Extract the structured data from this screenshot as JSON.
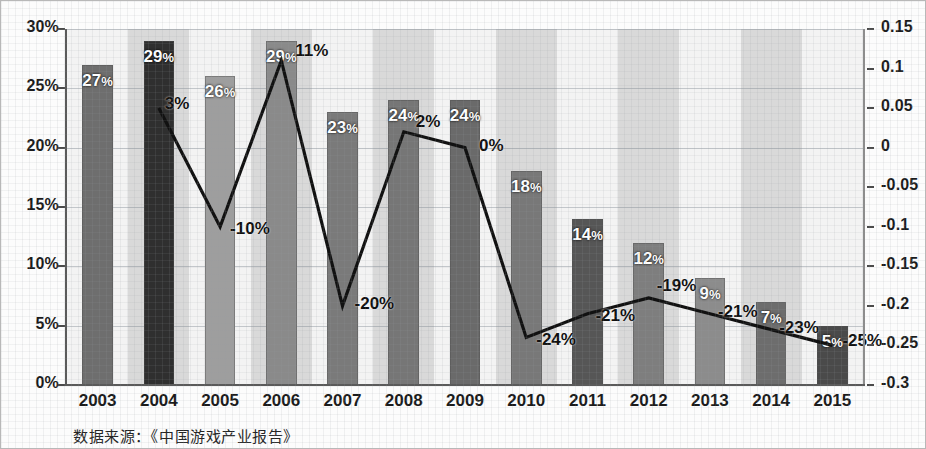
{
  "chart_data": {
    "type": "bar",
    "title": "",
    "subtitle": "",
    "xlabel": "",
    "ylabel": "",
    "categories": [
      "2003",
      "2004",
      "2005",
      "2006",
      "2007",
      "2008",
      "2009",
      "2010",
      "2011",
      "2012",
      "2013",
      "2014",
      "2015"
    ],
    "grid": true,
    "legend_position": "none",
    "series": [
      {
        "name": "bar-series",
        "chart_type": "bar",
        "axis": "left",
        "values": [
          27,
          29,
          26,
          29,
          23,
          24,
          24,
          18,
          14,
          12,
          9,
          7,
          5
        ],
        "labels": [
          "27%",
          "29%",
          "26%",
          "29%",
          "23%",
          "24%",
          "24%",
          "18%",
          "14%",
          "12%",
          "9%",
          "7%",
          "5%"
        ],
        "colors": [
          "#6e6e6e",
          "#2f2f2f",
          "#9e9e9e",
          "#8a8a8a",
          "#7a7a7a",
          "#767676",
          "#6a6a6a",
          "#787878",
          "#565656",
          "#7e7e7e",
          "#8c8c8c",
          "#6d6d6d",
          "#4a4a4a"
        ]
      },
      {
        "name": "line-series",
        "chart_type": "line",
        "axis": "right",
        "x": [
          "2004",
          "2005",
          "2006",
          "2007",
          "2008",
          "2009",
          "2010",
          "2011",
          "2012",
          "2013",
          "2014",
          "2015"
        ],
        "values": [
          0.05,
          -0.1,
          0.11,
          -0.2,
          0.02,
          0.0,
          -0.24,
          -0.21,
          -0.19,
          -0.21,
          -0.23,
          -0.25
        ],
        "labels": [
          "3%",
          "-10%",
          "11%",
          "-20%",
          "2%",
          "0%",
          "-24%",
          "-21%",
          "-19%",
          "-21%",
          "-23%",
          "-25%"
        ],
        "color": "#111111"
      }
    ],
    "left_axis": {
      "ticks": [
        "0%",
        "5%",
        "10%",
        "15%",
        "20%",
        "25%",
        "30%"
      ],
      "min": 0,
      "max": 30,
      "unit": "%"
    },
    "right_axis": {
      "ticks": [
        "-0.3",
        "-0.25",
        "-0.2",
        "-0.15",
        "-0.1",
        "-0.05",
        "0",
        "0.05",
        "0.1",
        "0.15"
      ],
      "min": -0.3,
      "max": 0.15
    },
    "source_note": "数据来源：《中国游戏产业报告》"
  }
}
